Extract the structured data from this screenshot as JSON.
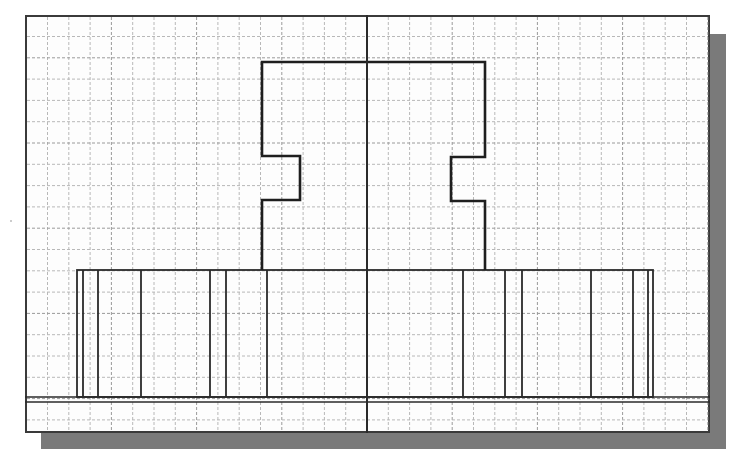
{
  "drawing": {
    "type": "engineering-sketch",
    "description": "Front view of a symmetric part on grid paper with vertical centerline",
    "sheet": {
      "x": 25,
      "y": 15,
      "width": 685,
      "height": 418,
      "border_color": "#3a3a3a",
      "background": "#fdfdfd"
    },
    "shadow": {
      "offset_x": 16,
      "offset_y": 16,
      "color": "#7a7a7a"
    },
    "grid": {
      "spacing": 21.3,
      "color": "#b8b8b8",
      "major_color": "#9a9a9a",
      "dash": "3,2"
    },
    "centerline": {
      "x": 367,
      "y1": 15,
      "y2": 433,
      "color": "#2a2a2a"
    },
    "upper_profile": {
      "color": "#1e1e1e",
      "points": [
        [
          262,
          270
        ],
        [
          262,
          200
        ],
        [
          300,
          200
        ],
        [
          300,
          156
        ],
        [
          262,
          156
        ],
        [
          262,
          62
        ],
        [
          485,
          62
        ],
        [
          485,
          157
        ],
        [
          451,
          157
        ],
        [
          451,
          201
        ],
        [
          485,
          201
        ],
        [
          485,
          270
        ]
      ]
    },
    "base_rectangle": {
      "x1": 77,
      "y1": 270,
      "x2": 653,
      "y2": 397,
      "color": "#2a2a2a"
    },
    "base_vertical_lines": [
      83,
      98,
      141,
      210,
      226,
      267,
      463,
      505,
      522,
      591,
      633,
      648
    ],
    "ground_lines": [
      {
        "y": 397,
        "x1": 25,
        "x2": 710
      },
      {
        "y": 402,
        "x1": 25,
        "x2": 710
      }
    ]
  }
}
